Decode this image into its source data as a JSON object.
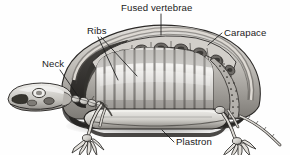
{
  "figure": {
    "name": "turtle-skeleton-cutaway",
    "background_color": "#fefefe",
    "ink_color": "#1b1b1b",
    "width": 290,
    "height": 155
  },
  "labels": [
    {
      "id": "fused-vertebrae",
      "text": "Fused vertebrae",
      "x": 121,
      "y": 11,
      "anchor": "start",
      "leader": "M 161 14 L 161 35",
      "describes": "row of fused vertebral arches along the top midline of the carapace"
    },
    {
      "id": "ribs",
      "text": "Ribs",
      "x": 87,
      "y": 34,
      "anchor": "start",
      "leader": "M 98 37 L 118 80 M 101 37 L 137 76",
      "describes": "broad flattened ribs forming vertical bands inside the shell"
    },
    {
      "id": "carapace",
      "text": "Carapace",
      "x": 224,
      "y": 36,
      "anchor": "start",
      "leader": "M 222 33 L 208 45",
      "describes": "upper domed portion of the shell"
    },
    {
      "id": "neck",
      "text": "Neck",
      "x": 42,
      "y": 67,
      "anchor": "start",
      "leader": "M 60 70 L 80 99",
      "describes": "chain of cervical vertebrae joining the skull to the shell"
    },
    {
      "id": "plastron",
      "text": "Plastron",
      "x": 176,
      "y": 145,
      "anchor": "start",
      "leader": "M 174 142 L 162 130",
      "describes": "flat lower portion of the shell"
    }
  ],
  "anatomy_parts": [
    {
      "id": "skull",
      "label": "skull"
    },
    {
      "id": "cervical-vertebrae",
      "label": "cervical vertebrae"
    },
    {
      "id": "fused-vertebrae-arches",
      "label": "fused vertebrae arches",
      "count": 8
    },
    {
      "id": "rib-bands",
      "label": "rib bands",
      "count": 12
    },
    {
      "id": "carapace-rim",
      "label": "carapace rim"
    },
    {
      "id": "plastron-plate",
      "label": "plastron plate"
    },
    {
      "id": "front-limb",
      "label": "front limb"
    },
    {
      "id": "hind-limb",
      "label": "hind limb"
    },
    {
      "id": "tail",
      "label": "tail"
    }
  ],
  "palette": {
    "ink": "#1b1b1b",
    "shell_light": "#e8e6e2",
    "shell_mid": "#b9b6b1",
    "shell_dark": "#6f6c68",
    "shell_deep": "#3a3836",
    "cavity_light": "#f2f1ee",
    "cavity_mid": "#c9c7c3",
    "cavity_dark": "#8a8782",
    "bone_light": "#efeeea",
    "bone_mid": "#c4c2bd",
    "bone_shadow": "#7d7a76",
    "shadow": "#2b2927"
  }
}
